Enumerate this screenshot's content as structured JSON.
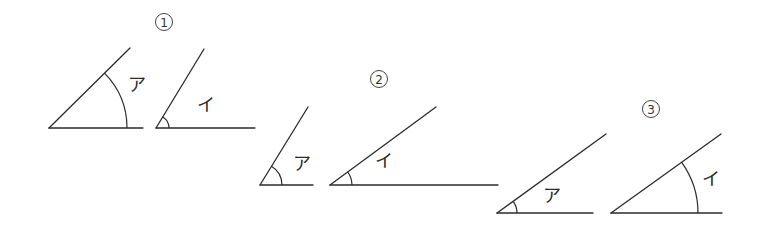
{
  "problems": [
    {
      "number": "1",
      "angles": [
        {
          "label": "ア",
          "vertex": [
            49,
            128
          ],
          "base_end": [
            143,
            128
          ],
          "ray_end": [
            130,
            48
          ],
          "arc_r": 78,
          "label_pos": [
            137,
            91
          ]
        },
        {
          "label": "イ",
          "vertex": [
            156,
            128
          ],
          "base_end": [
            255,
            128
          ],
          "ray_end": [
            204,
            49
          ],
          "arc_r": 13,
          "label_pos": [
            206,
            111
          ]
        }
      ]
    },
    {
      "number": "2",
      "angles": [
        {
          "label": "ア",
          "vertex": [
            260,
            185
          ],
          "base_end": [
            313,
            185
          ],
          "ray_end": [
            308,
            107
          ],
          "arc_r": 22,
          "label_pos": [
            302,
            170
          ]
        },
        {
          "label": "イ",
          "vertex": [
            330,
            185
          ],
          "base_end": [
            498,
            185
          ],
          "ray_end": [
            436,
            107
          ],
          "arc_r": 22,
          "label_pos": [
            384,
            167
          ]
        }
      ]
    },
    {
      "number": "3",
      "angles": [
        {
          "label": "ア",
          "vertex": [
            497,
            213
          ],
          "base_end": [
            593,
            213
          ],
          "ray_end": [
            606,
            134
          ],
          "arc_r": 20,
          "label_pos": [
            552,
            202
          ]
        },
        {
          "label": "イ",
          "vertex": [
            611,
            213
          ],
          "base_end": [
            722,
            213
          ],
          "ray_end": [
            721,
            134
          ],
          "arc_r": 87,
          "label_pos": [
            711,
            185
          ]
        }
      ]
    }
  ],
  "number_markers": [
    {
      "label": "1",
      "center": [
        164,
        22
      ]
    },
    {
      "label": "2",
      "center": [
        379,
        79
      ]
    },
    {
      "label": "3",
      "center": [
        651,
        109
      ]
    }
  ],
  "colors": {
    "stroke": "#2b2b2b",
    "background": "#ffffff"
  }
}
